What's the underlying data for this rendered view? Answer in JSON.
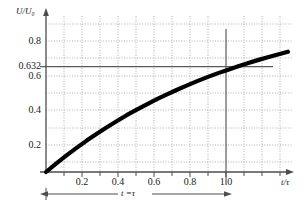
{
  "chart_data": {
    "type": "line",
    "title": "",
    "subtitle": "",
    "xlabel": "t/τ",
    "ylabel": "U/U₀",
    "xlim": [
      0,
      1.22
    ],
    "ylim": [
      0,
      0.95
    ],
    "grid": true,
    "grid_style": "dotted",
    "legend": "none",
    "x_ticks": [
      "0.2",
      "0.4",
      "0.6",
      "0.8",
      "1.0"
    ],
    "x_tick_values": [
      0.2,
      0.4,
      0.6,
      0.8,
      1.0
    ],
    "y_ticks": [
      "0.2",
      "0.4",
      "0.6",
      "0.632",
      "0.8"
    ],
    "y_tick_values": [
      0.2,
      0.4,
      0.6,
      0.632,
      0.8
    ],
    "series": [
      {
        "name": "U/U0 = 1 - exp(-t/tau)",
        "x": [
          0.0,
          0.05,
          0.1,
          0.15,
          0.2,
          0.25,
          0.3,
          0.35,
          0.4,
          0.45,
          0.5,
          0.55,
          0.6,
          0.65,
          0.7,
          0.75,
          0.8,
          0.85,
          0.9,
          0.95,
          1.0,
          1.05,
          1.1,
          1.15,
          1.2
        ],
        "values": [
          0.0,
          0.049,
          0.095,
          0.139,
          0.181,
          0.221,
          0.259,
          0.295,
          0.33,
          0.362,
          0.393,
          0.423,
          0.451,
          0.478,
          0.503,
          0.528,
          0.551,
          0.573,
          0.593,
          0.613,
          0.632,
          0.65,
          0.667,
          0.683,
          0.699
        ]
      }
    ],
    "annotations": [
      {
        "name": "tau-span",
        "text": "t = τ",
        "x_from": 0.0,
        "x_to": 1.0,
        "style": "double-headed-arrow"
      },
      {
        "name": "level-line",
        "text": "0.632",
        "y": 0.632,
        "style": "horizontal-reference-line"
      },
      {
        "name": "time-constant-line",
        "text": "1.0",
        "x": 1.0,
        "style": "vertical-reference-line"
      }
    ]
  },
  "labels": {
    "y_axis_name": "U/U₀",
    "x_axis_name": "t/τ",
    "tau_annotation_t": "t",
    "tau_annotation_eq": "=",
    "tau_annotation_tau": "τ",
    "y_0_8": "0.8",
    "y_0_632": "0.632",
    "y_0_6": "0.6",
    "y_0_4": "0.4",
    "y_0_2": "0.2",
    "x_0_2": "0.2",
    "x_0_4": "0.4",
    "x_0_6": "0.6",
    "x_0_8": "0.8",
    "x_1_0": "1.0"
  },
  "colors": {
    "curve": "#000000",
    "axis": "#4d4d4d",
    "grid": "#8c8c8c",
    "reference_line": "#5a5a5a",
    "text": "#1a1a1a",
    "background": "#ffffff"
  }
}
